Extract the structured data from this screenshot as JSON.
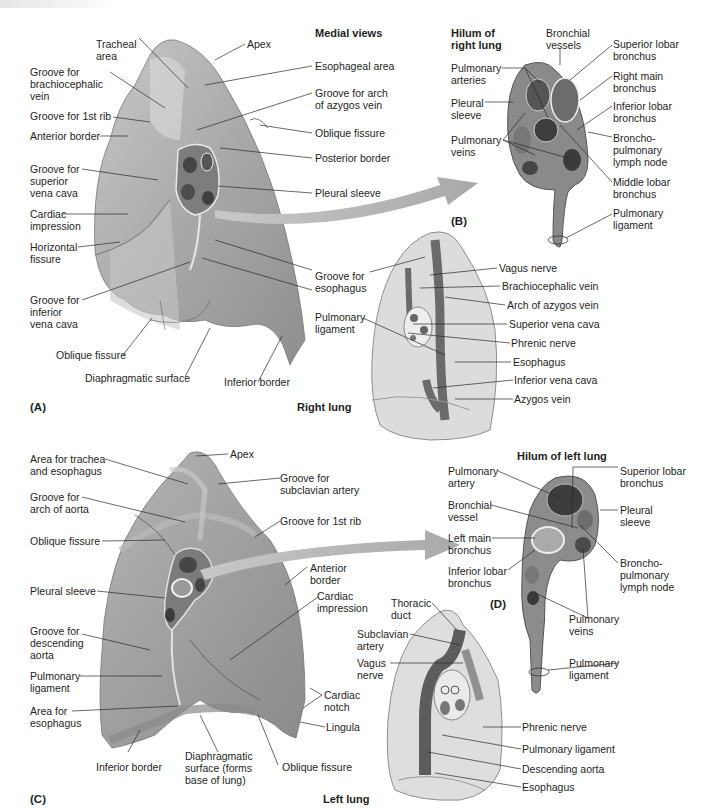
{
  "header": {
    "fragment": ""
  },
  "section_titles": {
    "medial_views": "Medial views",
    "hilum_right": "Hilum of\nright lung",
    "hilum_left": "Hilum of left lung",
    "right_lung": "Right lung",
    "left_lung": "Left lung"
  },
  "panels": {
    "a": "(A)",
    "b": "(B)",
    "c": "(C)",
    "d": "(D)"
  },
  "colors": {
    "lung_surface": "#a9a9a9",
    "lung_light": "#d4d4d4",
    "schematic_fill": "#dedede",
    "structure_dark": "#6a6a6a",
    "arrow": "#b4b4b4",
    "leader_line": "#2a2a2a"
  },
  "panel_a": {
    "labels": [
      {
        "id": "tracheal-area",
        "text": "Tracheal\narea"
      },
      {
        "id": "apex",
        "text": "Apex"
      },
      {
        "id": "groove-brachiocephalic-vein",
        "text": "Groove for\nbrachiocephalic\nvein"
      },
      {
        "id": "groove-1st-rib",
        "text": "Groove for 1st rib"
      },
      {
        "id": "anterior-border",
        "text": "Anterior border"
      },
      {
        "id": "groove-svc",
        "text": "Groove for\nsuperior\nvena cava"
      },
      {
        "id": "cardiac-impression",
        "text": "Cardiac\nimpression"
      },
      {
        "id": "horizontal-fissure",
        "text": "Horizontal\nfissure"
      },
      {
        "id": "groove-ivc",
        "text": "Groove for\ninferior\nvena cava"
      },
      {
        "id": "oblique-fissure",
        "text": "Oblique fissure"
      },
      {
        "id": "diaphragmatic-surface",
        "text": "Diaphragmatic surface"
      },
      {
        "id": "inferior-border",
        "text": "Inferior border"
      },
      {
        "id": "esophageal-area",
        "text": "Esophageal area"
      },
      {
        "id": "groove-arch-azygos",
        "text": "Groove for arch\nof azygos vein"
      },
      {
        "id": "oblique-fissure-r",
        "text": "Oblique fissure"
      },
      {
        "id": "posterior-border",
        "text": "Posterior border"
      },
      {
        "id": "pleural-sleeve",
        "text": "Pleural sleeve"
      },
      {
        "id": "groove-esophagus",
        "text": "Groove for\nesophagus"
      },
      {
        "id": "pulmonary-ligament",
        "text": "Pulmonary\nligament"
      }
    ]
  },
  "panel_b": {
    "labels": [
      {
        "id": "bronchial-vessels",
        "text": "Bronchial\nvessels"
      },
      {
        "id": "pulmonary-arteries",
        "text": "Pulmonary\narteries"
      },
      {
        "id": "pleural-sleeve",
        "text": "Pleural\nsleeve"
      },
      {
        "id": "pulmonary-veins",
        "text": "Pulmonary\nveins"
      },
      {
        "id": "superior-lobar-bronchus",
        "text": "Superior lobar\nbronchus"
      },
      {
        "id": "right-main-bronchus",
        "text": "Right main\nbronchus"
      },
      {
        "id": "inferior-lobar-bronchus",
        "text": "Inferior lobar\nbronchus"
      },
      {
        "id": "bronchopulmonary-lymph-node",
        "text": "Broncho-\npulmonary\nlymph node"
      },
      {
        "id": "middle-lobar-bronchus",
        "text": "Middle lobar\nbronchus"
      },
      {
        "id": "pulmonary-ligament",
        "text": "Pulmonary\nligament"
      }
    ]
  },
  "right_schematic": {
    "labels": [
      {
        "id": "groove-esophagus",
        "text": "Groove for\nesophagus"
      },
      {
        "id": "pulmonary-ligament",
        "text": "Pulmonary\nligament"
      },
      {
        "id": "vagus-nerve",
        "text": "Vagus nerve"
      },
      {
        "id": "brachiocephalic-vein",
        "text": "Brachiocephalic vein"
      },
      {
        "id": "arch-azygos-vein",
        "text": "Arch of azygos vein"
      },
      {
        "id": "superior-vena-cava",
        "text": "Superior vena cava"
      },
      {
        "id": "phrenic-nerve",
        "text": "Phrenic nerve"
      },
      {
        "id": "esophagus",
        "text": "Esophagus"
      },
      {
        "id": "inferior-vena-cava",
        "text": "Inferior vena cava"
      },
      {
        "id": "azygos-vein",
        "text": "Azygos vein"
      }
    ]
  },
  "panel_c": {
    "labels": [
      {
        "id": "area-trachea-esophagus",
        "text": "Area for trachea\nand esophagus"
      },
      {
        "id": "apex",
        "text": "Apex"
      },
      {
        "id": "groove-subclavian-artery",
        "text": "Groove for\nsubclavian artery"
      },
      {
        "id": "groove-arch-aorta",
        "text": "Groove for\narch of aorta"
      },
      {
        "id": "groove-1st-rib",
        "text": "Groove for 1st rib"
      },
      {
        "id": "oblique-fissure",
        "text": "Oblique fissure"
      },
      {
        "id": "anterior-border",
        "text": "Anterior\nborder"
      },
      {
        "id": "cardiac-impression",
        "text": "Cardiac\nimpression"
      },
      {
        "id": "pleural-sleeve",
        "text": "Pleural sleeve"
      },
      {
        "id": "groove-descending-aorta",
        "text": "Groove for\ndescending\naorta"
      },
      {
        "id": "pulmonary-ligament",
        "text": "Pulmonary\nligament"
      },
      {
        "id": "area-esophagus",
        "text": "Area for\nesophagus"
      },
      {
        "id": "cardiac-notch",
        "text": "Cardiac\nnotch"
      },
      {
        "id": "lingula",
        "text": "Lingula"
      },
      {
        "id": "inferior-border",
        "text": "Inferior border"
      },
      {
        "id": "diaphragmatic-surface",
        "text": "Diaphragmatic\nsurface (forms\nbase of lung)"
      },
      {
        "id": "oblique-fissure-b",
        "text": "Oblique fissure"
      }
    ]
  },
  "panel_d": {
    "labels": [
      {
        "id": "pulmonary-artery",
        "text": "Pulmonary\nartery"
      },
      {
        "id": "bronchial-vessel",
        "text": "Bronchial\nvessel"
      },
      {
        "id": "left-main-bronchus",
        "text": "Left main\nbronchus"
      },
      {
        "id": "inferior-lobar-bronchus",
        "text": "Inferior lobar\nbronchus"
      },
      {
        "id": "superior-lobar-bronchus",
        "text": "Superior lobar\nbronchus"
      },
      {
        "id": "pleural-sleeve",
        "text": "Pleural\nsleeve"
      },
      {
        "id": "bronchopulmonary-lymph-node",
        "text": "Broncho-\npulmonary\nlymph node"
      },
      {
        "id": "pulmonary-veins",
        "text": "Pulmonary\nveins"
      },
      {
        "id": "pulmonary-ligament",
        "text": "Pulmonary\nligament"
      }
    ]
  },
  "left_schematic": {
    "labels": [
      {
        "id": "thoracic-duct",
        "text": "Thoracic\nduct"
      },
      {
        "id": "subclavian-artery",
        "text": "Subclavian\nartery"
      },
      {
        "id": "vagus-nerve",
        "text": "Vagus\nnerve"
      },
      {
        "id": "phrenic-nerve",
        "text": "Phrenic nerve"
      },
      {
        "id": "pulmonary-ligament",
        "text": "Pulmonary ligament"
      },
      {
        "id": "descending-aorta",
        "text": "Descending aorta"
      },
      {
        "id": "esophagus",
        "text": "Esophagus"
      }
    ]
  }
}
